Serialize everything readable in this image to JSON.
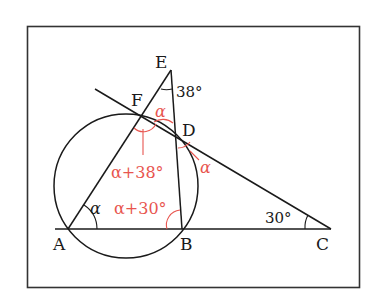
{
  "diagram": {
    "type": "geometry",
    "points": {
      "A": {
        "label": "A",
        "x": 68,
        "y": 229
      },
      "B": {
        "label": "B",
        "x": 182,
        "y": 229
      },
      "C": {
        "label": "C",
        "x": 331,
        "y": 229
      },
      "D": {
        "label": "D",
        "x": 175,
        "y": 134
      },
      "E": {
        "label": "E",
        "x": 171,
        "y": 70
      },
      "F": {
        "label": "F",
        "x": 142,
        "y": 116
      }
    },
    "circle": {
      "cx": 126,
      "cy": 186,
      "r": 72
    },
    "angles": {
      "E": "38°",
      "C": "30°",
      "A": "α",
      "AFD_label": "α+38°",
      "ABD_label": "α+30°",
      "EFD": "α",
      "CDB": "α"
    },
    "colors": {
      "line": "#1a1a1a",
      "annotation": "#e8554f",
      "frame": "#333333"
    }
  }
}
